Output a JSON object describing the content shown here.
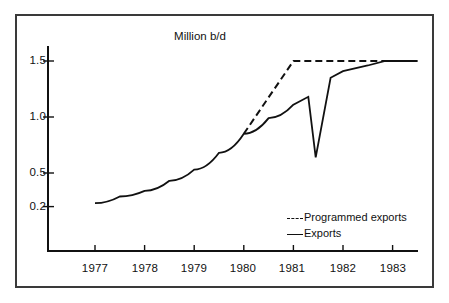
{
  "chart_data": {
    "type": "line",
    "title": "Million b/d",
    "xlabel": "",
    "ylabel": "",
    "grid": false,
    "legend_position": "inside-lower-right",
    "x_ticks": [
      "1977",
      "1978",
      "1979",
      "1980",
      "1981",
      "1982",
      "1983"
    ],
    "y_ticks": [
      "1.5",
      "1.0",
      "0.5",
      "0.2"
    ],
    "y_tick_values": [
      1.5,
      1.0,
      0.5,
      0.2
    ],
    "xlim": [
      1976.4,
      1983.5
    ],
    "ylim": [
      0.08,
      1.6
    ],
    "series": [
      {
        "name": "Exports",
        "style": "solid",
        "color": "#111111",
        "x": [
          1977.0,
          1977.5,
          1978.0,
          1978.5,
          1979.0,
          1979.5,
          1980.0,
          1980.5,
          1981.0,
          1981.3,
          1981.45,
          1981.75,
          1982.0,
          1982.5,
          1982.85,
          1983.5
        ],
        "values": [
          0.23,
          0.29,
          0.34,
          0.43,
          0.53,
          0.68,
          0.85,
          0.99,
          1.11,
          1.18,
          0.64,
          1.35,
          1.41,
          1.46,
          1.5,
          1.5
        ]
      },
      {
        "name": "Programmed exports",
        "style": "dashed",
        "color": "#111111",
        "x": [
          1980.0,
          1981.0,
          1983.5
        ],
        "values": [
          0.85,
          1.5,
          1.5
        ]
      }
    ],
    "legend": [
      {
        "label": "Programmed exports",
        "style": "dashed"
      },
      {
        "label": "Exports",
        "style": "solid"
      }
    ]
  },
  "colors": {
    "ink": "#111111",
    "frame": "#3a3a3a",
    "background": "#ffffff"
  }
}
